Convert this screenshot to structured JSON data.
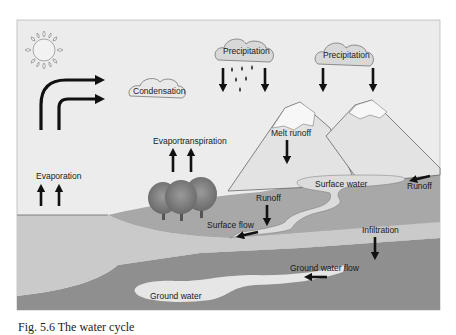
{
  "figure": {
    "caption": "Fig. 5.6  The water cycle",
    "colors": {
      "sky": "#ececec",
      "land_green": "#a9a9a9",
      "lake": "#c8c8c8",
      "soil": "#bdbdbd",
      "ground_layer": "#8f8f8f",
      "ground_water": "#e6e6e6",
      "mountain": "#e3e3e3",
      "snow": "#f7f7f7",
      "arrow": "#111111",
      "outline": "#555555"
    },
    "labels": {
      "condensation": "Condensation",
      "precipitation_1": "Precipitation",
      "precipitation_2": "Precipitation",
      "evaporation": "Evaporation",
      "evapotranspiration": "Evaportranspiration",
      "melt_runoff": "Melt runoff",
      "surface_water": "Surface water",
      "runoff_right": "Runoff",
      "runoff_center": "Runoff",
      "surface_flow": "Surface flow",
      "infiltration": "Infiltration",
      "ground_water_flow": "Ground water flow",
      "ground_water": "Ground water"
    },
    "icons": [
      "sun-icon",
      "cloud-icon",
      "rain-drop-icon",
      "tree-icon",
      "mountain-icon",
      "arrow-icon"
    ]
  }
}
